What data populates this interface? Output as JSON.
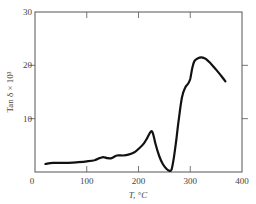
{
  "chart_data": {
    "type": "line",
    "title": "",
    "xlabel": "T, °C",
    "ylabel": "Tan δ × 10³",
    "xlim": [
      0,
      400
    ],
    "ylim": [
      0,
      30
    ],
    "xticks": [
      0,
      100,
      200,
      300,
      400
    ],
    "yticks": [
      10,
      20,
      30
    ],
    "xtick_labels": [
      "0",
      "100",
      "200",
      "300",
      "400"
    ],
    "ytick_labels": [
      "10",
      "20",
      "30"
    ],
    "grid": false,
    "legend": null,
    "series": [
      {
        "name": "tan δ",
        "x": [
          20,
          35,
          50,
          65,
          80,
          100,
          115,
          125,
          132,
          140,
          148,
          158,
          170,
          182,
          192,
          202,
          210,
          217,
          224,
          228,
          233,
          240,
          247,
          254,
          260,
          264,
          268,
          273,
          278,
          284,
          290,
          296,
          300,
          304,
          308,
          314,
          322,
          330,
          340,
          350,
          360,
          368
        ],
        "y": [
          1.5,
          1.7,
          1.7,
          1.7,
          1.8,
          2.0,
          2.2,
          2.6,
          2.8,
          2.6,
          2.6,
          3.1,
          3.1,
          3.3,
          3.7,
          4.5,
          5.3,
          6.4,
          7.6,
          7.2,
          5.2,
          3.0,
          1.5,
          0.6,
          0.2,
          0.5,
          2.5,
          6.0,
          10.0,
          14.0,
          15.8,
          16.6,
          17.5,
          19.5,
          20.8,
          21.3,
          21.5,
          21.2,
          20.3,
          19.2,
          18.0,
          17.0
        ]
      }
    ]
  },
  "axes": {
    "xlabel": "T, °C",
    "ylabel": "Tan δ × 10³"
  },
  "colors": {
    "line": "#111111",
    "axis": "#555555"
  }
}
